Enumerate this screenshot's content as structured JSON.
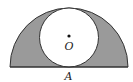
{
  "diagram": {
    "labels": {
      "center": "O",
      "base_point": "A"
    },
    "colors": {
      "shaded": "#9a9a9a",
      "stroke": "#333333",
      "background": "#ffffff"
    },
    "shapes": {
      "semicircle": {
        "cx": 69,
        "cy": 67,
        "r": 59
      },
      "inner_circle": {
        "cx": 69,
        "cy": 37.5,
        "r": 29.5
      },
      "center_dot": {
        "cx": 69,
        "cy": 36,
        "r": 1.6
      }
    }
  }
}
